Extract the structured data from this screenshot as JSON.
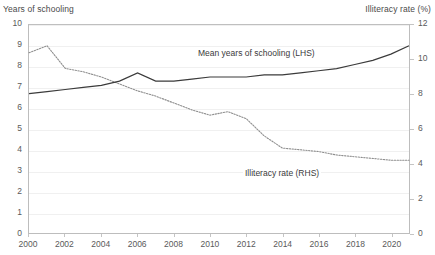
{
  "axes": {
    "left_title": "Years of schooling",
    "right_title": "Illiteracy rate (%)",
    "left_ticks": [
      "10",
      "9",
      "8",
      "7",
      "6",
      "5",
      "4",
      "3",
      "2",
      "1",
      "0"
    ],
    "right_ticks": [
      "12",
      "10",
      "8",
      "6",
      "4",
      "2",
      "0"
    ],
    "x_ticks": [
      "2000",
      "2002",
      "2004",
      "2006",
      "2008",
      "2010",
      "2012",
      "2014",
      "2016",
      "2018",
      "2020"
    ]
  },
  "annotations": {
    "schooling": "Mean years of schooling (LHS)",
    "illiteracy": "Illiteracy rate (RHS)"
  },
  "colors": {
    "schooling_line": "#3b3b3b",
    "illiteracy_line": "#8f8f8f",
    "gridline": "#f0f0f0",
    "axis": "#bdbdbd",
    "text": "#3a3a3a"
  },
  "chart_data": {
    "type": "line",
    "title": "",
    "xlabel": "",
    "grid": true,
    "legend_position": "inline-annotations",
    "x": [
      2000,
      2001,
      2002,
      2003,
      2004,
      2005,
      2006,
      2007,
      2008,
      2009,
      2010,
      2011,
      2012,
      2013,
      2014,
      2015,
      2016,
      2017,
      2018,
      2019,
      2020,
      2021
    ],
    "axis_left": {
      "label": "Years of schooling",
      "ylim": [
        0,
        10
      ],
      "ticks": [
        0,
        1,
        2,
        3,
        4,
        5,
        6,
        7,
        8,
        9,
        10
      ]
    },
    "axis_right": {
      "label": "Illiteracy rate (%)",
      "ylim": [
        0,
        12
      ],
      "ticks": [
        0,
        2,
        4,
        6,
        8,
        10,
        12
      ]
    },
    "series": [
      {
        "name": "Mean years of schooling (LHS)",
        "axis": "left",
        "style": "solid",
        "values": [
          6.7,
          6.8,
          6.9,
          7.0,
          7.1,
          7.3,
          7.7,
          7.3,
          7.3,
          7.4,
          7.5,
          7.5,
          7.5,
          7.6,
          7.6,
          7.7,
          7.8,
          7.9,
          8.1,
          8.3,
          8.6,
          9.0
        ]
      },
      {
        "name": "Illiteracy rate (RHS)",
        "axis": "right",
        "style": "dotted",
        "values": [
          10.4,
          10.8,
          9.5,
          9.3,
          9.0,
          8.6,
          8.2,
          7.9,
          7.5,
          7.1,
          6.8,
          7.0,
          6.6,
          5.6,
          4.9,
          4.8,
          4.7,
          4.5,
          4.4,
          4.3,
          4.2,
          4.2
        ]
      }
    ]
  }
}
